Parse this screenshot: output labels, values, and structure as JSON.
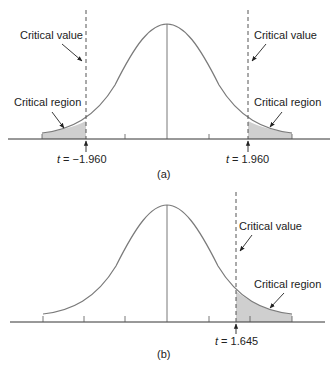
{
  "panel_a": {
    "caption": "(a)",
    "left_critical_value_label": "Critical value",
    "right_critical_value_label": "Critical value",
    "left_critical_region_label": "Critical region",
    "right_critical_region_label": "Critical region",
    "left_t_prefix": "t",
    "left_t_value": " = −1.960",
    "right_t_prefix": "t",
    "right_t_value": " = 1.960"
  },
  "panel_b": {
    "caption": "(b)",
    "critical_value_label": "Critical value",
    "critical_region_label": "Critical region",
    "t_prefix": "t",
    "t_value": " = 1.645"
  },
  "colors": {
    "curve": "#7a7a7a",
    "shade": "#cfcfcf",
    "axis": "#333333",
    "text": "#222222"
  }
}
